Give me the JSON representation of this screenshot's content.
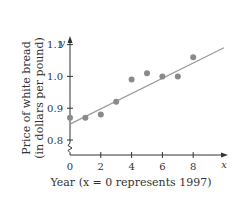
{
  "chart_data": {
    "type": "scatter",
    "title": "",
    "xlabel": "Year (x = 0 represents 1997)",
    "ylabel_line1": "Price of white bread",
    "ylabel_line2": "(in dollars per pound)",
    "x_axis_letter": "x",
    "y_axis_letter": "y",
    "x_ticks": [
      "0",
      "2",
      "4",
      "6",
      "8"
    ],
    "y_ticks": [
      "0.8",
      "0.9",
      "1.0",
      "1.1"
    ],
    "xlim": [
      0,
      10
    ],
    "ylim": [
      0.8,
      1.15
    ],
    "y_axis_break": true,
    "grid": false,
    "points": [
      {
        "x": 0,
        "y": 0.87
      },
      {
        "x": 1,
        "y": 0.87
      },
      {
        "x": 2,
        "y": 0.88
      },
      {
        "x": 3,
        "y": 0.92
      },
      {
        "x": 4,
        "y": 0.99
      },
      {
        "x": 5,
        "y": 1.01
      },
      {
        "x": 6,
        "y": 1.0
      },
      {
        "x": 7,
        "y": 1.0
      },
      {
        "x": 8,
        "y": 1.06
      }
    ],
    "trend_line": {
      "x0": 0,
      "y0": 0.85,
      "x1": 10,
      "y1": 1.09
    },
    "colors": {
      "points": "#8a8a8a",
      "line": "#9a9a9a",
      "axes": "#333333"
    }
  }
}
